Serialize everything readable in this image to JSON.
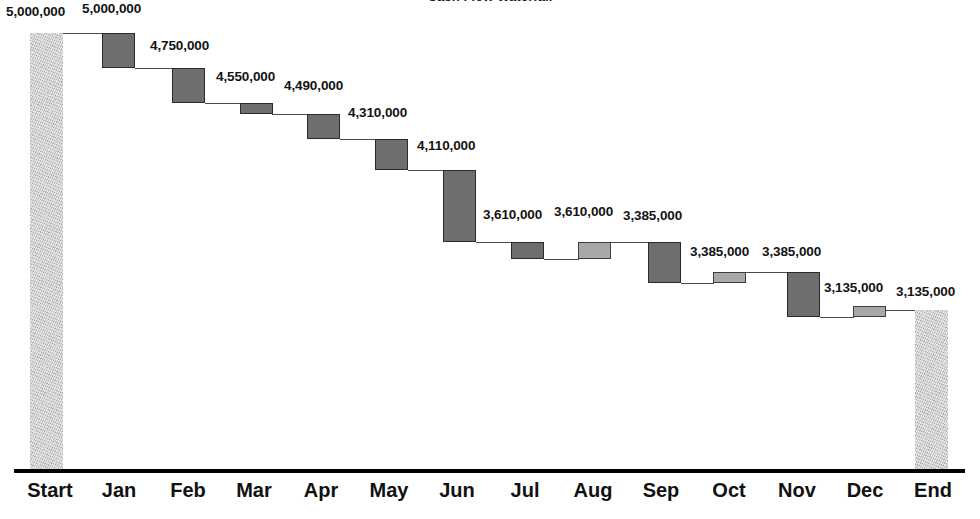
{
  "chart": {
    "title": "Cash Flow Waterfall",
    "type": "waterfall"
  },
  "chart_data": {
    "type": "bar",
    "subtype": "waterfall",
    "title": "Cash Flow Waterfall",
    "xlabel": "",
    "ylabel": "",
    "grid": false,
    "legend": null,
    "ylim": [
      0,
      5000000
    ],
    "value_format": "#,##0",
    "categories": [
      "Start",
      "Jan",
      "Feb",
      "Mar",
      "Apr",
      "May",
      "Jun",
      "Jul",
      "Aug",
      "Sep",
      "Oct",
      "Nov",
      "Dec",
      "End"
    ],
    "cumulative_values": [
      5000000,
      5000000,
      4750000,
      4550000,
      4490000,
      4310000,
      4110000,
      3610000,
      3610000,
      3385000,
      3385000,
      3385000,
      3135000,
      3135000
    ],
    "deltas": [
      null,
      -250000,
      -200000,
      -60000,
      -180000,
      -200000,
      -500000,
      0,
      -225000,
      0,
      0,
      -250000,
      0,
      null
    ],
    "bar_kinds": [
      "anchor",
      "dark",
      "dark",
      "dark",
      "dark",
      "dark",
      "dark",
      "dark",
      "light",
      "dark",
      "light",
      "dark",
      "light",
      "anchor"
    ],
    "labels": [
      {
        "category": "Start",
        "text": "5,000,000",
        "value": 5000000
      },
      {
        "category": "Jan",
        "text": "5,000,000",
        "value": 5000000
      },
      {
        "category": "Feb",
        "text": "4,750,000",
        "value": 4750000
      },
      {
        "category": "Mar",
        "text": "4,550,000",
        "value": 4550000
      },
      {
        "category": "Apr",
        "text": "4,490,000",
        "value": 4490000
      },
      {
        "category": "May",
        "text": "4,310,000",
        "value": 4310000
      },
      {
        "category": "Jun",
        "text": "4,110,000",
        "value": 4110000
      },
      {
        "category": "Jul",
        "text": "3,610,000",
        "value": 3610000
      },
      {
        "category": "Aug",
        "text": "3,610,000",
        "value": 3610000
      },
      {
        "category": "Sep",
        "text": "3,385,000",
        "value": 3385000
      },
      {
        "category": "Oct",
        "text": "3,385,000",
        "value": 3385000
      },
      {
        "category": "Nov",
        "text": "3,385,000",
        "value": 3385000
      },
      {
        "category": "Dec",
        "text": "3,135,000",
        "value": 3135000
      },
      {
        "category": "End",
        "text": "3,135,000",
        "value": 3135000
      }
    ],
    "colors": {
      "bar_dark": "#6e6e6e",
      "bar_light": "#a8a8a8",
      "bar_anchor": "#cfcfcf",
      "bar_outline": "#2b2b2b",
      "connector": "#4a4a4a",
      "axis": "#000000",
      "text": "#111111",
      "background": "#ffffff"
    }
  },
  "axis": {
    "ticks": [
      {
        "label": "Start"
      },
      {
        "label": "Jan"
      },
      {
        "label": "Feb"
      },
      {
        "label": "Mar"
      },
      {
        "label": "Apr"
      },
      {
        "label": "May"
      },
      {
        "label": "Jun"
      },
      {
        "label": "Jul"
      },
      {
        "label": "Aug"
      },
      {
        "label": "Sep"
      },
      {
        "label": "Oct"
      },
      {
        "label": "Nov"
      },
      {
        "label": "Dec"
      },
      {
        "label": "End"
      }
    ]
  },
  "geometry": {
    "bars": [
      {
        "name": "start",
        "x": 30,
        "w": 33,
        "top": 33,
        "bottom": 471,
        "kind": "anchor"
      },
      {
        "name": "jan",
        "x": 102,
        "w": 33,
        "top": 33,
        "bottom": 68,
        "kind": "dark"
      },
      {
        "name": "feb",
        "x": 172,
        "w": 33,
        "top": 68,
        "bottom": 103,
        "kind": "dark"
      },
      {
        "name": "mar",
        "x": 240,
        "w": 33,
        "top": 103,
        "bottom": 114,
        "kind": "dark"
      },
      {
        "name": "apr",
        "x": 307,
        "w": 33,
        "top": 114,
        "bottom": 139,
        "kind": "dark"
      },
      {
        "name": "may",
        "x": 375,
        "w": 33,
        "top": 139,
        "bottom": 170,
        "kind": "dark"
      },
      {
        "name": "jun",
        "x": 443,
        "w": 33,
        "top": 170,
        "bottom": 242,
        "kind": "dark"
      },
      {
        "name": "jul",
        "x": 511,
        "w": 33,
        "top": 242,
        "bottom": 259,
        "kind": "dark"
      },
      {
        "name": "aug",
        "x": 578,
        "w": 33,
        "top": 242,
        "bottom": 259,
        "kind": "light"
      },
      {
        "name": "sep",
        "x": 648,
        "w": 33,
        "top": 242,
        "bottom": 283,
        "kind": "dark"
      },
      {
        "name": "oct",
        "x": 713,
        "w": 33,
        "top": 272,
        "bottom": 283,
        "kind": "light"
      },
      {
        "name": "nov",
        "x": 787,
        "w": 33,
        "top": 272,
        "bottom": 317,
        "kind": "dark"
      },
      {
        "name": "dec",
        "x": 853,
        "w": 33,
        "top": 306,
        "bottom": 317,
        "kind": "light"
      },
      {
        "name": "end",
        "x": 915,
        "w": 33,
        "top": 310,
        "bottom": 471,
        "kind": "anchor"
      }
    ],
    "connectors": [
      {
        "x": 63,
        "w": 40,
        "y": 33
      },
      {
        "x": 135,
        "w": 38,
        "y": 68
      },
      {
        "x": 205,
        "w": 36,
        "y": 103
      },
      {
        "x": 272,
        "w": 36,
        "y": 114
      },
      {
        "x": 340,
        "w": 36,
        "y": 139
      },
      {
        "x": 408,
        "w": 36,
        "y": 170
      },
      {
        "x": 476,
        "w": 36,
        "y": 242
      },
      {
        "x": 544,
        "w": 35,
        "y": 259
      },
      {
        "x": 610,
        "w": 39,
        "y": 242
      },
      {
        "x": 681,
        "w": 33,
        "y": 283
      },
      {
        "x": 745,
        "w": 43,
        "y": 272
      },
      {
        "x": 820,
        "w": 34,
        "y": 317
      },
      {
        "x": 885,
        "w": 31,
        "y": 310
      }
    ],
    "data_labels": [
      {
        "name": "start",
        "x": 6,
        "y": 4,
        "key": 0
      },
      {
        "name": "jan",
        "x": 82,
        "y": 1,
        "key": 1
      },
      {
        "name": "feb",
        "x": 150,
        "y": 38,
        "key": 2
      },
      {
        "name": "mar",
        "x": 216,
        "y": 69,
        "key": 3
      },
      {
        "name": "apr",
        "x": 284,
        "y": 78,
        "key": 4
      },
      {
        "name": "may",
        "x": 348,
        "y": 105,
        "key": 5
      },
      {
        "name": "jun",
        "x": 417,
        "y": 138,
        "key": 6
      },
      {
        "name": "jul",
        "x": 483,
        "y": 207,
        "key": 7
      },
      {
        "name": "aug",
        "x": 554,
        "y": 204,
        "key": 8
      },
      {
        "name": "sep",
        "x": 623,
        "y": 208,
        "key": 9
      },
      {
        "name": "oct",
        "x": 690,
        "y": 244,
        "key": 10
      },
      {
        "name": "nov",
        "x": 762,
        "y": 244,
        "key": 11
      },
      {
        "name": "dec",
        "x": 824,
        "y": 280,
        "key": 12
      },
      {
        "name": "end",
        "x": 896,
        "y": 284,
        "key": 13
      }
    ],
    "xlabel_centers": [
      50,
      119,
      188,
      254,
      321,
      389,
      457,
      525,
      593,
      661,
      729,
      797,
      865,
      933
    ]
  }
}
